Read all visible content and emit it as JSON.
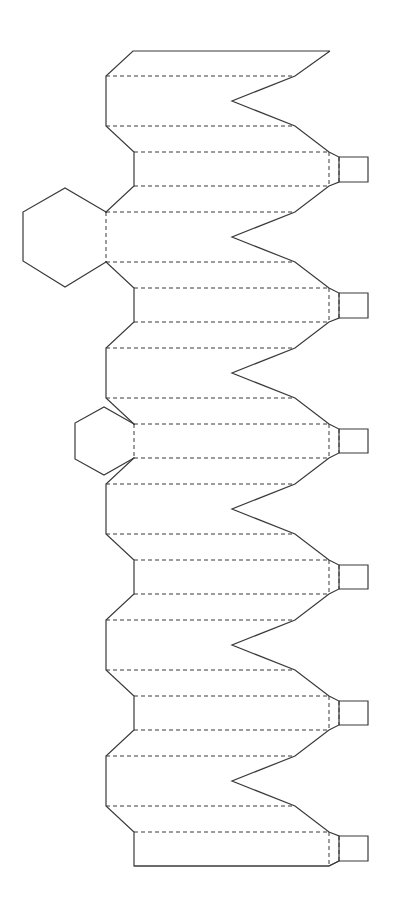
{
  "diagram": {
    "title": "Paper net template with cut and fold lines",
    "legend": {
      "cut_line": "solid",
      "fold_line": "dashed"
    },
    "colors": {
      "line": "#3a3a3a",
      "background": "#ffffff"
    },
    "geometry": {
      "left_outer_x": 106,
      "left_inner_x": 134,
      "right_band_end_x": 295,
      "tab_fold_x1": 329,
      "tab_fold_x2": 339,
      "tab_right_x": 368,
      "notch_tip_x": 232,
      "top_edge": {
        "y": 51,
        "x1": 133,
        "x2": 330
      },
      "bottom_edge": {
        "y": 866,
        "x1": 134,
        "x2": 329
      }
    },
    "notch_bands": [
      {
        "y_top": 76,
        "y_tip": 101,
        "y_bottom": 126
      },
      {
        "y_top": 212,
        "y_tip": 237,
        "y_bottom": 262
      },
      {
        "y_top": 348,
        "y_tip": 373,
        "y_bottom": 398
      },
      {
        "y_top": 484,
        "y_tip": 509,
        "y_bottom": 534
      },
      {
        "y_top": 620,
        "y_tip": 645,
        "y_bottom": 670
      },
      {
        "y_top": 756,
        "y_tip": 781,
        "y_bottom": 806
      }
    ],
    "tab_bands": [
      {
        "y_top": 152,
        "y_bottom": 186,
        "tab_top": 157,
        "tab_bottom": 182
      },
      {
        "y_top": 288,
        "y_bottom": 322,
        "tab_top": 293,
        "tab_bottom": 318
      },
      {
        "y_top": 424,
        "y_bottom": 458,
        "tab_top": 429,
        "tab_bottom": 453
      },
      {
        "y_top": 560,
        "y_bottom": 594,
        "tab_top": 565,
        "tab_bottom": 589
      },
      {
        "y_top": 696,
        "y_bottom": 730,
        "tab_top": 701,
        "tab_bottom": 725
      },
      {
        "y_top": 832,
        "y_bottom": 866,
        "tab_top": 836,
        "tab_bottom": 861
      }
    ],
    "hexagons": [
      {
        "name": "large-hexagon",
        "points": [
          [
            65,
            188
          ],
          [
            23,
            212
          ],
          [
            23,
            261
          ],
          [
            65,
            287
          ],
          [
            106,
            262
          ],
          [
            106,
            212
          ]
        ],
        "fold_edge": [
          [
            106,
            212
          ],
          [
            106,
            262
          ]
        ]
      },
      {
        "name": "small-hexagon",
        "points": [
          [
            104,
            407
          ],
          [
            75,
            423
          ],
          [
            75,
            459
          ],
          [
            104,
            475
          ],
          [
            134,
            458
          ],
          [
            134,
            424
          ]
        ],
        "fold_edge": [
          [
            134,
            424
          ],
          [
            134,
            458
          ]
        ]
      }
    ]
  }
}
